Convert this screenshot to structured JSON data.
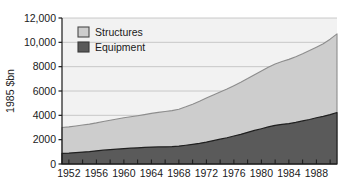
{
  "chart_data": {
    "type": "area",
    "title": "",
    "subtitle": "",
    "xlabel": "",
    "ylabel": "1985 $bn",
    "stacked": true,
    "grid": true,
    "legend_position": "top-left",
    "xlim": [
      1951,
      1991
    ],
    "ylim": [
      0,
      12000
    ],
    "yticks": [
      0,
      2000,
      4000,
      6000,
      8000,
      10000,
      12000
    ],
    "ytick_labels": [
      "0",
      "2000",
      "4000",
      "6000",
      "8000",
      "10,000",
      "12,000"
    ],
    "xticks": [
      1952,
      1956,
      1960,
      1964,
      1968,
      1972,
      1976,
      1980,
      1984,
      1988
    ],
    "xtick_labels": [
      "1952",
      "1956",
      "1960",
      "1964",
      "1968",
      "1972",
      "1976",
      "1980",
      "1984",
      "1988"
    ],
    "x": [
      1951,
      1952,
      1953,
      1954,
      1955,
      1956,
      1957,
      1958,
      1959,
      1960,
      1961,
      1962,
      1963,
      1964,
      1965,
      1966,
      1967,
      1968,
      1969,
      1970,
      1971,
      1972,
      1973,
      1974,
      1975,
      1976,
      1977,
      1978,
      1979,
      1980,
      1981,
      1982,
      1983,
      1984,
      1985,
      1986,
      1987,
      1988,
      1989,
      1990,
      1991
    ],
    "series": [
      {
        "name": "Equipment",
        "color": "#5a5a5a",
        "values": [
          880,
          900,
          940,
          980,
          1020,
          1080,
          1140,
          1180,
          1220,
          1270,
          1300,
          1330,
          1360,
          1390,
          1400,
          1410,
          1430,
          1470,
          1540,
          1620,
          1700,
          1800,
          1920,
          2040,
          2160,
          2300,
          2440,
          2600,
          2760,
          2900,
          3050,
          3180,
          3260,
          3320,
          3420,
          3540,
          3660,
          3800,
          3920,
          4060,
          4230
        ]
      },
      {
        "name": "Structures",
        "color": "#cdcdcd",
        "values": [
          2120,
          2150,
          2180,
          2220,
          2260,
          2300,
          2360,
          2420,
          2480,
          2530,
          2580,
          2640,
          2700,
          2770,
          2840,
          2900,
          2960,
          3030,
          3160,
          3300,
          3460,
          3620,
          3760,
          3880,
          4000,
          4140,
          4280,
          4420,
          4580,
          4750,
          4900,
          5040,
          5160,
          5280,
          5400,
          5520,
          5660,
          5800,
          5960,
          6200,
          6470
        ]
      }
    ],
    "totals": [
      3000,
      3050,
      3120,
      3200,
      3280,
      3380,
      3500,
      3600,
      3700,
      3800,
      3880,
      3970,
      4060,
      4160,
      4240,
      4310,
      4390,
      4500,
      4700,
      4920,
      5160,
      5420,
      5680,
      5920,
      6160,
      6440,
      6720,
      7020,
      7340,
      7650,
      7950,
      8220,
      8420,
      8600,
      8820,
      9060,
      9320,
      9600,
      9880,
      10260,
      10700
    ]
  },
  "legend": {
    "items": [
      {
        "label": "Structures",
        "color": "#cdcdcd"
      },
      {
        "label": "Equipment",
        "color": "#5a5a5a"
      }
    ]
  },
  "axis": {
    "y_title": "1985 $bn"
  }
}
